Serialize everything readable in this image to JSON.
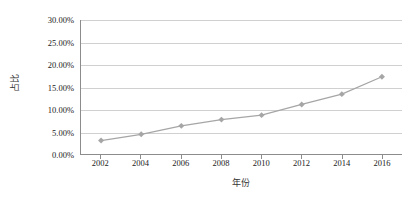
{
  "chart_data": {
    "type": "line",
    "title": "",
    "subtitle": "",
    "xlabel": "年份",
    "ylabel": "占比",
    "categories": [
      "2002",
      "2004",
      "2006",
      "2008",
      "2010",
      "2012",
      "2014",
      "2016"
    ],
    "x": [
      2002,
      2004,
      2006,
      2008,
      2010,
      2012,
      2014,
      2016
    ],
    "series": [
      {
        "name": "占比",
        "values": [
          3.0,
          4.4,
          6.3,
          7.7,
          8.7,
          11.1,
          13.4,
          17.3
        ]
      }
    ],
    "values": [
      3.0,
      4.4,
      6.3,
      7.7,
      8.7,
      11.1,
      13.4,
      17.3
    ],
    "ylim": [
      0,
      30
    ],
    "ytick_values": [
      0,
      5,
      10,
      15,
      20,
      25,
      30
    ],
    "ytick_labels": [
      "0.00%",
      "5.00%",
      "10.00%",
      "15.00%",
      "20.00%",
      "25.00%",
      "30.00%"
    ],
    "xtick_labels": [
      "2002",
      "2004",
      "2006",
      "2008",
      "2010",
      "2012",
      "2014",
      "2016"
    ],
    "grid": true,
    "grid_axis": "y",
    "legend": false,
    "legend_position": "none",
    "annotations": [],
    "line_color": "#a6a6a6",
    "marker_color": "#a6a6a6",
    "marker_shape": "diamond",
    "gridline_color": "#d0d0d0",
    "axis_color": "#8c8c8c",
    "background_color": "#ffffff",
    "text_color": "#222222"
  }
}
